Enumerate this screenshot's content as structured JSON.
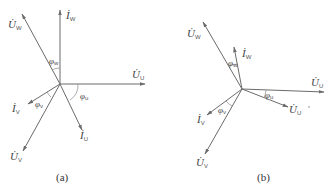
{
  "diagram_a": {
    "caption": "(a)",
    "labels": {
      "U_W": {
        "main": "U̇",
        "sub": "W"
      },
      "I_W": {
        "main": "İ",
        "sub": "W"
      },
      "U_U": {
        "main": "U̇",
        "sub": "U"
      },
      "I_U": {
        "main": "İ",
        "sub": "U"
      },
      "I_V": {
        "main": "İ",
        "sub": "V"
      },
      "U_V": {
        "main": "U̇",
        "sub": "V"
      }
    },
    "angles": {
      "phi_w": {
        "main": "φ",
        "sub": "w"
      },
      "phi_u": {
        "main": "φ",
        "sub": "u"
      },
      "phi_v": {
        "main": "φ",
        "sub": "v"
      }
    }
  },
  "diagram_b": {
    "caption": "(b)",
    "labels": {
      "U_W": {
        "main": "U̇",
        "sub": "W"
      },
      "I_W": {
        "main": "İ",
        "sub": "W"
      },
      "U_U": {
        "main": "U̇",
        "sub": "U"
      },
      "I_U": {
        "main": "U̇",
        "sub": "U"
      },
      "I_V": {
        "main": "İ",
        "sub": "V"
      },
      "U_V": {
        "main": "U̇",
        "sub": "V"
      }
    },
    "angles": {
      "phi_w": {
        "main": "φ",
        "sub": "w"
      },
      "phi_u": {
        "main": "φ",
        "sub": "u"
      },
      "phi_v": {
        "main": "φ",
        "sub": "v"
      }
    }
  },
  "colors": {
    "line": "#6b6b6b",
    "text": "#444444",
    "background": "#ffffff"
  }
}
